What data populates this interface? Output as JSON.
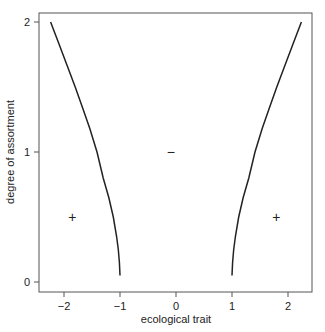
{
  "chart_data": {
    "type": "line",
    "title": "",
    "xlabel": "ecological trait",
    "ylabel": "degree of assortment",
    "xlim": [
      -2.45,
      2.4
    ],
    "ylim": [
      -0.08,
      2.08
    ],
    "x_ticks": [
      -2,
      -1,
      0,
      1,
      2
    ],
    "x_tick_labels": [
      "−2",
      "−1",
      "0",
      "1",
      "2"
    ],
    "y_ticks": [
      0,
      1,
      2
    ],
    "y_tick_labels": [
      "0",
      "1",
      "2"
    ],
    "grid": false,
    "legend": null,
    "series": [
      {
        "name": "left boundary",
        "x": [
          -1.0,
          -1.01,
          -1.03,
          -1.06,
          -1.12,
          -1.2,
          -1.3,
          -1.41,
          -1.54,
          -1.66,
          -1.8,
          -1.94,
          -2.09,
          -2.24
        ],
        "y": [
          0.05,
          0.15,
          0.25,
          0.35,
          0.5,
          0.65,
          0.8,
          1.0,
          1.18,
          1.33,
          1.5,
          1.66,
          1.83,
          2.0
        ]
      },
      {
        "name": "right boundary",
        "x": [
          1.0,
          1.01,
          1.03,
          1.06,
          1.12,
          1.2,
          1.3,
          1.41,
          1.54,
          1.66,
          1.8,
          1.94,
          2.09,
          2.24
        ],
        "y": [
          0.05,
          0.15,
          0.25,
          0.35,
          0.5,
          0.65,
          0.8,
          1.0,
          1.18,
          1.33,
          1.5,
          1.66,
          1.83,
          2.0
        ]
      }
    ],
    "annotations": [
      {
        "text": "+",
        "x": -1.85,
        "y": 0.5
      },
      {
        "text": "−",
        "x": -0.09,
        "y": 1.0
      },
      {
        "text": "+",
        "x": 1.79,
        "y": 0.5
      }
    ]
  }
}
